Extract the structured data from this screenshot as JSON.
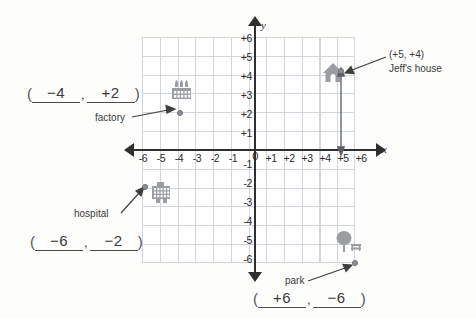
{
  "worksheet": {
    "type": "coordinate-plane-exercise",
    "axis_labels": {
      "x": "x",
      "y": "y"
    },
    "origin_label": "0",
    "x_ticks": [
      "-6",
      "-5",
      "-4",
      "-3",
      "-2",
      "-1",
      "+1",
      "+2",
      "+3",
      "+4",
      "+5",
      "+6"
    ],
    "y_ticks_positive": [
      "+6",
      "+5",
      "+4",
      "+3",
      "+2",
      "+1"
    ],
    "y_ticks_negative": [
      "-1",
      "-2",
      "-3",
      "-4",
      "-5",
      "-6"
    ],
    "grid_range": {
      "xmin": -6,
      "xmax": 6,
      "ymin": -6,
      "ymax": 6
    }
  },
  "example": {
    "coordinate_text": "(+5, +4)",
    "name": "Jeff's house",
    "icon": "house-icon",
    "x": 5,
    "y": 4
  },
  "places": [
    {
      "id": "factory",
      "label": "factory",
      "icon": "factory-icon",
      "x": -4,
      "y": 2,
      "answer": {
        "open_paren": "(",
        "x_value": "−4",
        "comma": ",",
        "y_value": "+2",
        "close_paren": ")"
      }
    },
    {
      "id": "hospital",
      "label": "hospital",
      "icon": "hospital-icon",
      "x": -6,
      "y": -2,
      "answer": {
        "open_paren": "(",
        "x_value": "−6",
        "comma": ",",
        "y_value": "−2",
        "close_paren": ")"
      }
    },
    {
      "id": "park",
      "label": "park",
      "icon": "park-icon",
      "x": 6,
      "y": -6,
      "answer": {
        "open_paren": "(",
        "x_value": "+6",
        "comma": ",",
        "y_value": "−6",
        "close_paren": ")"
      }
    }
  ],
  "colors": {
    "grid_line": "#cfd6dd",
    "axis": "#2f2f2f",
    "marker": "#8d8f94",
    "icon": "#9a9da2",
    "text": "#3a3a3a",
    "paper": "#fdfdfc"
  }
}
